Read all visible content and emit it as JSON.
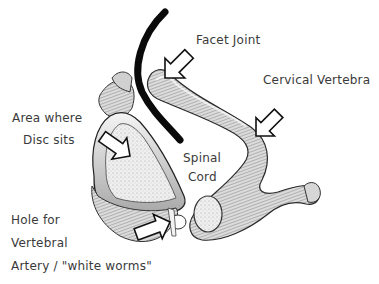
{
  "diagram": {
    "labels": {
      "facet_joint": "Facet Joint",
      "cervical_vertebra": "Cervical Vertebra",
      "area_where_line1": "Area where",
      "area_where_line2": "Disc sits",
      "spinal_line1": "Spinal",
      "spinal_line2": "Cord",
      "hole_line1": "Hole for",
      "hole_line2": "Vertebral",
      "hole_line3": "Artery / \"white worms\""
    },
    "colors": {
      "background": "#ffffff",
      "ink": "#1a1a1a",
      "bone_light": "#ececec",
      "bone_mid": "#bdbdbd",
      "bone_dark": "#6e6e6e",
      "label_text": "#3a3a3a"
    },
    "annotations": [
      {
        "label": "Facet Joint",
        "arrow": "outline, pointing down-left"
      },
      {
        "label": "Cervical Vertebra",
        "arrow": "outline, pointing down-left"
      },
      {
        "label": "Area where Disc sits",
        "arrow": "outline, pointing down-right"
      },
      {
        "label": "Hole for Vertebral Artery / \"white worms\"",
        "arrow": "outline, pointing up-right"
      },
      {
        "label": "Spinal Cord",
        "marker": "thick black curved line"
      }
    ]
  }
}
